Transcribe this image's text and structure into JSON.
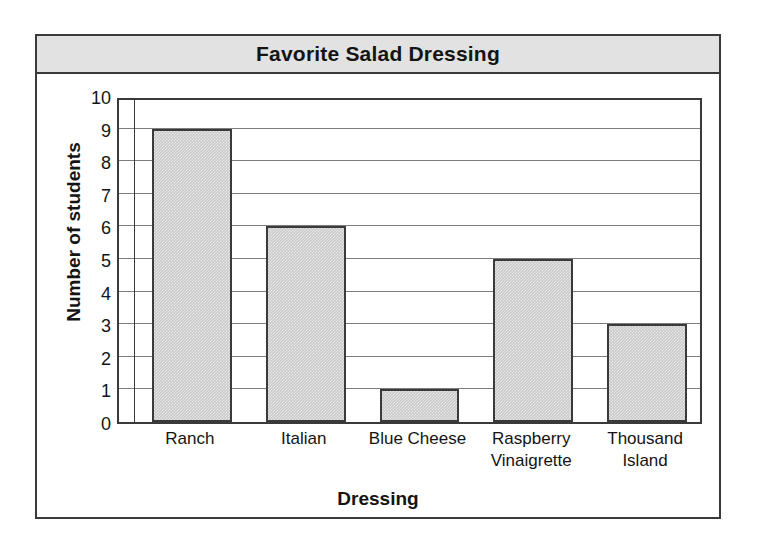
{
  "chart_data": {
    "type": "bar",
    "title": "Favorite Salad Dressing",
    "xlabel": "Dressing",
    "ylabel": "Number of students",
    "categories": [
      "Ranch",
      "Italian",
      "Blue Cheese",
      "Raspberry Vinaigrette",
      "Thousand Island"
    ],
    "category_lines": [
      [
        "Ranch"
      ],
      [
        "Italian"
      ],
      [
        "Blue Cheese"
      ],
      [
        "Raspberry",
        "Vinaigrette"
      ],
      [
        "Thousand",
        "Island"
      ]
    ],
    "values": [
      9,
      6,
      1,
      5,
      3
    ],
    "ylim": [
      0,
      10
    ],
    "ytick_step": 1,
    "yticks": [
      "10",
      "9",
      "8",
      "7",
      "6",
      "5",
      "4",
      "3",
      "2",
      "1",
      "0"
    ],
    "grid": true,
    "legend": "none",
    "bar_fill_color": "#c9c9c9",
    "bar_border_color": "#3a3a3a",
    "banner_color": "#e2e2e2",
    "frame_color": "#3a3a3a",
    "gridline_color": "#7d7d7d",
    "background_color": "#ffffff"
  }
}
